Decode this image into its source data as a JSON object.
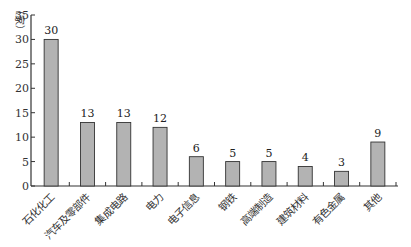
{
  "chart_data": {
    "type": "bar",
    "title": "",
    "xlabel": "",
    "ylabel": "（家）",
    "ylim": [
      0,
      35
    ],
    "yticks": [
      0,
      5,
      10,
      15,
      20,
      25,
      30,
      35
    ],
    "grid": false,
    "legend": null,
    "categories": [
      "石化化工",
      "汽车及零部件",
      "集成电路",
      "电力",
      "电子信息",
      "钢铁",
      "高端制造",
      "建筑材料",
      "有色金属",
      "其他"
    ],
    "values": [
      30,
      13,
      13,
      12,
      6,
      5,
      5,
      4,
      3,
      9
    ],
    "data_labels": [
      "30",
      "13",
      "13",
      "12",
      "6",
      "5",
      "5",
      "4",
      "3",
      "9"
    ],
    "bar_color": "#b3b3b3",
    "bar_edge_color": "#333333",
    "axis_color": "#333333"
  }
}
